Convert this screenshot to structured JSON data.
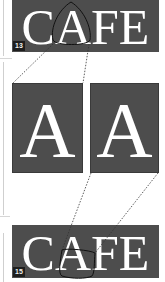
{
  "top_figure": {
    "word": "CAFE",
    "label": "13"
  },
  "middle_figure": {
    "left_letter": "A",
    "right_letter": "A"
  },
  "bottom_figure": {
    "word": "CAFE",
    "label": "15"
  },
  "colors": {
    "panel_bg": "#4d4d4d",
    "text": "#ffffff",
    "badge_bg": "#1e1e1e",
    "dotted_line": "#333333"
  }
}
